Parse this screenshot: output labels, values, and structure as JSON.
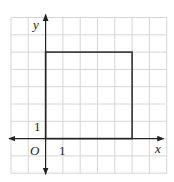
{
  "diagram": {
    "type": "coordinate-grid",
    "grid": {
      "columns": 9,
      "rows": 9,
      "line_color": "#d6d6d6",
      "origin_col": 2,
      "origin_row": 7
    },
    "axes": {
      "x_label": "x",
      "y_label": "y",
      "origin_label": "O",
      "x_tick_label": "1",
      "y_tick_label": "1",
      "color": "#222222"
    },
    "shape": {
      "type": "square",
      "vertices": [
        [
          0,
          0
        ],
        [
          5,
          0
        ],
        [
          5,
          5
        ],
        [
          0,
          5
        ]
      ],
      "stroke": "#333333"
    }
  }
}
